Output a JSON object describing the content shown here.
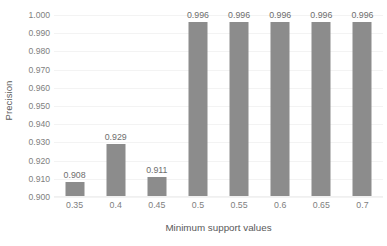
{
  "chart_data": {
    "type": "bar",
    "title": "",
    "subtitle": "",
    "xlabel": "Minimum support values",
    "ylabel": "Precision",
    "categories": [
      "0.35",
      "0.4",
      "0.45",
      "0.5",
      "0.55",
      "0.6",
      "0.65",
      "0.7"
    ],
    "values": [
      0.908,
      0.929,
      0.911,
      0.996,
      0.996,
      0.996,
      0.996,
      0.996
    ],
    "data_labels": [
      "0.908",
      "0.929",
      "0.911",
      "0.996",
      "0.996",
      "0.996",
      "0.996",
      "0.996"
    ],
    "ylim": [
      0.9,
      1.0
    ],
    "ytick_step": 0.01,
    "ytick_labels": [
      "1.000",
      "0.990",
      "0.980",
      "0.970",
      "0.960",
      "0.950",
      "0.940",
      "0.930",
      "0.920",
      "0.910",
      "0.900"
    ],
    "ytick_values": [
      1.0,
      0.99,
      0.98,
      0.97,
      0.96,
      0.95,
      0.94,
      0.93,
      0.92,
      0.91,
      0.9
    ],
    "grid": {
      "horizontal": true,
      "vertical": false
    },
    "legend": {
      "visible": false,
      "position": "none",
      "entries": []
    },
    "colors": {
      "bar": "#8c8c8c",
      "gridline": "#f3f3f3",
      "axis_line": "#f0f0f0",
      "tick_text": "#808080",
      "axis_title_text": "#595959",
      "data_label_text": "#6e6e6e",
      "background": "#ffffff"
    },
    "annotations": []
  }
}
